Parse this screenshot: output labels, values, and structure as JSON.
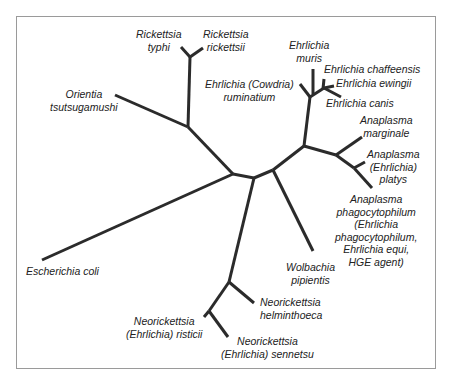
{
  "diagram": {
    "type": "unrooted-phylogenetic-tree",
    "taxa": {
      "rickettsia_typhi": [
        "Rickettsia",
        "typhi"
      ],
      "rickettsia_rickettsii": [
        "Rickettsia",
        "rickettsii"
      ],
      "orientia": [
        "Orientia",
        "tsutsugamushi"
      ],
      "escherichia_coli": [
        "Escherichia coli"
      ],
      "ehrlichia_muris": [
        "Ehrlichia",
        "muris"
      ],
      "ehrlichia_ruminatium": [
        "Ehrlichia (Cowdria)",
        "ruminatium"
      ],
      "ehrlichia_chaffeensis": [
        "Ehrlichia chaffeensis"
      ],
      "ehrlichia_ewingii": [
        "Ehrlichia ewingii"
      ],
      "ehrlichia_canis": [
        "Ehrlichia canis"
      ],
      "anaplasma_marginale": [
        "Anaplasma",
        "marginale"
      ],
      "anaplasma_platys": [
        "Anaplasma",
        "(Ehrlichia)",
        "platys"
      ],
      "anaplasma_phagocytophilum": [
        "Anaplasma",
        "phagocytophilum",
        "(Ehrlichia",
        "phagocytophilum,",
        "Ehrlichia equi,",
        "HGE agent)"
      ],
      "wolbachia": [
        "Wolbachia",
        "pipientis"
      ],
      "neorickettsia_helminthoeca": [
        "Neorickettsia",
        "helminthoeca"
      ],
      "neorickettsia_risticii": [
        "Neorickettsia",
        "(Ehrlichia) risticii"
      ],
      "neorickettsia_sennetsu": [
        "Neorickettsia",
        "(Ehrlichia) sennetsu"
      ]
    },
    "colors": {
      "branch": "#2b2b2b",
      "frame": "#9a9a9a",
      "text": "#222222"
    }
  }
}
